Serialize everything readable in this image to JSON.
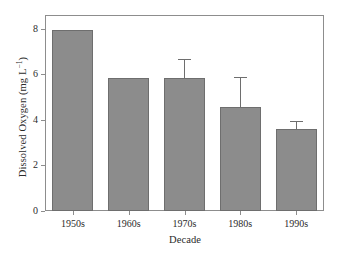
{
  "chart_data": {
    "type": "bar",
    "title": "",
    "xlabel": "Decade",
    "ylabel": "Dissolved Oxygen (mg L",
    "ylabel_sup": "−1",
    "ylabel_tail": ")",
    "categories": [
      "1950s",
      "1960s",
      "1970s",
      "1980s",
      "1990s"
    ],
    "values": [
      7.95,
      5.85,
      5.85,
      4.55,
      3.6
    ],
    "errors": [
      null,
      null,
      0.8,
      1.35,
      0.35
    ],
    "ylim": [
      0,
      8.6
    ],
    "yticks": [
      0,
      2,
      4,
      6,
      8
    ],
    "ytick_labels": [
      "0",
      "2",
      "4",
      "6",
      "8"
    ],
    "grid": false,
    "legend": null,
    "bar_color": "#8c8c8c",
    "bar_edge_color": "#6e6e6e",
    "axis_color": "#8d8d8d",
    "background": "#ffffff"
  }
}
